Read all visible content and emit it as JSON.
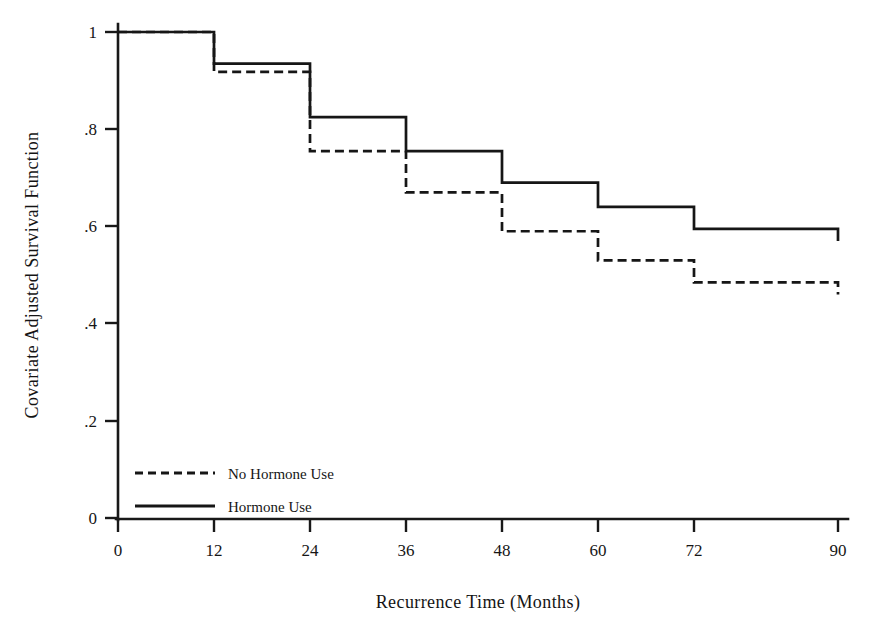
{
  "chart_data": {
    "type": "line",
    "title": "",
    "subtitle": "",
    "xlabel": "Recurrence Time (Months)",
    "ylabel": "Covariate Adjusted Survival Function",
    "xlim": [
      0,
      90
    ],
    "ylim": [
      0,
      1
    ],
    "grid": false,
    "legend_position": "inside-bottom-left",
    "x_ticks": [
      0,
      12,
      24,
      36,
      48,
      60,
      72,
      90
    ],
    "x_tick_labels": [
      "0",
      "12",
      "24",
      "36",
      "48",
      "60",
      "72",
      "90"
    ],
    "y_ticks": [
      0,
      0.2,
      0.4,
      0.6,
      0.8,
      1
    ],
    "y_tick_labels": [
      "0",
      ".2",
      ".4",
      ".6",
      ".8",
      "1"
    ],
    "step_style": "post",
    "x": [
      0,
      12,
      24,
      36,
      48,
      60,
      72,
      90
    ],
    "series": [
      {
        "name": "No Hormone Use",
        "line_style": "dashed",
        "color": "#161616",
        "values": [
          1.0,
          0.918,
          0.755,
          0.67,
          0.59,
          0.53,
          0.485,
          0.46
        ]
      },
      {
        "name": "Hormone Use",
        "line_style": "solid",
        "color": "#161616",
        "values": [
          1.0,
          0.935,
          0.825,
          0.755,
          0.69,
          0.64,
          0.595,
          0.57
        ]
      }
    ],
    "annotations": []
  },
  "legend": {
    "entries": [
      {
        "label": "No Hormone Use",
        "style": "dashed"
      },
      {
        "label": "Hormone Use",
        "style": "solid"
      }
    ]
  }
}
